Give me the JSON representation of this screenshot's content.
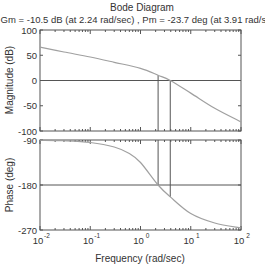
{
  "chart_data": {
    "type": "line",
    "title": "Bode Diagram",
    "subtitle": "Gm = -10.5 dB (at 2.24 rad/sec) ,  Pm = -23.7 deg (at 3.91 rad/sec)",
    "xlabel": "Frequency  (rad/sec)",
    "xscale": "log",
    "xlim": [
      0.01,
      100
    ],
    "x_ticks": [
      {
        "value": 0.01,
        "base": "10",
        "exp": "-2"
      },
      {
        "value": 0.1,
        "base": "10",
        "exp": "-1"
      },
      {
        "value": 1,
        "base": "10",
        "exp": "0"
      },
      {
        "value": 10,
        "base": "10",
        "exp": "1"
      },
      {
        "value": 100,
        "base": "10",
        "exp": "2"
      }
    ],
    "grid": false,
    "panels": [
      {
        "name": "magnitude",
        "ylabel": "Magnitude (dB)",
        "ylim": [
          -100,
          100
        ],
        "yticks": [
          100,
          50,
          0,
          -50,
          -100
        ],
        "reference_line": 0,
        "series": [
          {
            "name": "magnitude",
            "x": [
              0.01,
              0.03,
              0.1,
              0.3,
              1,
              2.24,
              3.91,
              10,
              30,
              100
            ],
            "y": [
              66,
              56.5,
              46.5,
              36,
              24,
              10.5,
              0,
              -25,
              -55,
              -82
            ]
          }
        ],
        "markers": [
          {
            "x": 2.24,
            "from": 10.5,
            "to": -100
          },
          {
            "x": 3.91,
            "from": 0,
            "to": -100
          }
        ]
      },
      {
        "name": "phase",
        "ylabel": "Phase (deg)",
        "ylim": [
          -270,
          -90
        ],
        "yticks": [
          -90,
          -180,
          -270
        ],
        "reference_line": -180,
        "series": [
          {
            "name": "phase",
            "x": [
              0.01,
              0.03,
              0.1,
              0.3,
              0.6,
              1,
              2.24,
              3.91,
              10,
              30,
              100
            ],
            "y": [
              -90.5,
              -91.5,
              -95,
              -104,
              -117,
              -135,
              -180,
              -203.7,
              -237,
              -256,
              -266
            ]
          }
        ],
        "markers": [
          {
            "x": 2.24,
            "from": -90,
            "to": -180
          },
          {
            "x": 3.91,
            "from": -90,
            "to": -203.7
          }
        ]
      }
    ],
    "colors": {
      "curve": "#a0a0a0",
      "axes": "#555555",
      "lines": "#555555"
    }
  }
}
